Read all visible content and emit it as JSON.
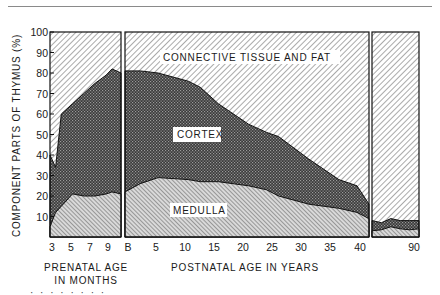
{
  "chart_data": {
    "type": "area",
    "title": "",
    "ylabel": "COMPONENT PARTS OF THYMUS (%)",
    "ylim": [
      0,
      100
    ],
    "yticks": [
      10,
      20,
      30,
      40,
      50,
      60,
      70,
      80,
      90,
      100
    ],
    "panels": [
      {
        "name": "prenatal",
        "xlabel": [
          "PRENATAL AGE",
          "IN MONTHS"
        ],
        "xticks": [
          "3",
          "5",
          "7",
          "9"
        ],
        "x": [
          3,
          3.5,
          4,
          5,
          6,
          7,
          8,
          8.5,
          9
        ],
        "series": [
          {
            "name": "MEDULLA",
            "cumulative_top": [
              5,
              12,
              15,
              21,
              20,
              20,
              21,
              22,
              21
            ]
          },
          {
            "name": "CORTEX",
            "cumulative_top": [
              40,
              34,
              60,
              65,
              70,
              75,
              79,
              82,
              80
            ]
          },
          {
            "name": "CONNECTIVE TISSUE AND FAT",
            "cumulative_top": [
              100,
              100,
              100,
              100,
              100,
              100,
              100,
              100,
              100
            ]
          }
        ]
      },
      {
        "name": "postnatal",
        "xlabel": "POSTNATAL AGE IN YEARS",
        "xticks": [
          "B",
          "5",
          "10",
          "15",
          "20",
          "25",
          "30",
          "35",
          "40"
        ],
        "x": [
          0,
          2,
          5,
          10,
          12,
          15,
          20,
          23,
          25,
          30,
          35,
          38,
          40
        ],
        "series": [
          {
            "name": "MEDULLA",
            "cumulative_top": [
              22,
              26,
              29,
              28,
              27,
              27,
              25,
              23,
              20,
              16,
              14,
              12,
              9
            ]
          },
          {
            "name": "CORTEX",
            "cumulative_top": [
              81,
              81,
              80,
              76,
              73,
              65,
              55,
              51,
              49,
              38,
              28,
              25,
              16
            ]
          },
          {
            "name": "CONNECTIVE TISSUE AND FAT",
            "cumulative_top": [
              100,
              100,
              100,
              100,
              100,
              100,
              100,
              100,
              100,
              100,
              100,
              100,
              100
            ]
          }
        ]
      },
      {
        "name": "postnatal-late",
        "xticks": [
          "90"
        ],
        "x": [
          40,
          50,
          60,
          70,
          80,
          90
        ],
        "series": [
          {
            "name": "MEDULLA",
            "cumulative_top": [
              3,
              3.5,
              5,
              4,
              3.5,
              4
            ]
          },
          {
            "name": "CORTEX",
            "cumulative_top": [
              8,
              7,
              9,
              8,
              8,
              8
            ]
          },
          {
            "name": "CONNECTIVE TISSUE AND FAT",
            "cumulative_top": [
              100,
              100,
              100,
              100,
              100,
              100
            ]
          }
        ]
      }
    ],
    "region_labels": [
      "CONNECTIVE TISSUE AND FAT",
      "CORTEX",
      "MEDULLA"
    ],
    "grid": false,
    "legend": "inline labels"
  },
  "labels": {
    "ylabel": "COMPONENT PARTS OF THYMUS (%)",
    "prenatal_line1": "PRENATAL AGE",
    "prenatal_line2": "IN MONTHS",
    "postnatal": "POSTNATAL AGE IN YEARS",
    "connective": "CONNECTIVE TISSUE AND FAT",
    "cortex": "CORTEX",
    "medulla": "MEDULLA"
  },
  "yticks": [
    "100",
    "90",
    "80",
    "70",
    "60",
    "50",
    "40",
    "30",
    "20",
    "10"
  ],
  "xticks_prenatal": [
    "3",
    "5",
    "7",
    "9"
  ],
  "xticks_postnatal": [
    "B",
    "5",
    "10",
    "15",
    "20",
    "25",
    "30",
    "35",
    "40"
  ],
  "xticks_late": [
    "90"
  ],
  "caption_fragment": "· · · · · · · ·"
}
